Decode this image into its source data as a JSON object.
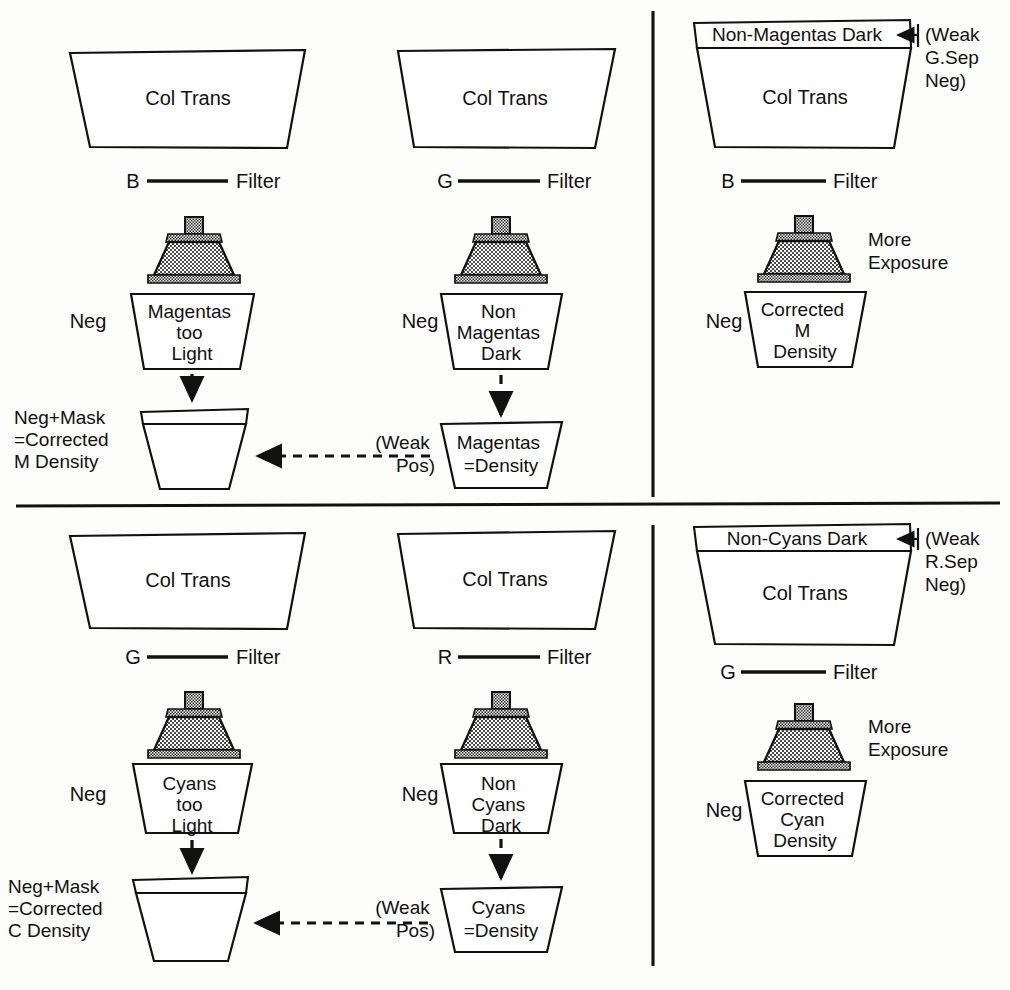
{
  "diagram": {
    "ink": "#111111",
    "paper": "#fdfdfb",
    "icon_names": {
      "enlarger": "enlarger-icon",
      "arrow_down": "arrow-down-icon",
      "arrow_left": "arrow-left-icon",
      "filter_line": "filter-line-icon"
    }
  },
  "panels": [
    {
      "id": "magenta",
      "columns": [
        {
          "id": "m-left",
          "source": {
            "label": "Col Trans"
          },
          "filter": {
            "channel": "B",
            "label": "Filter"
          },
          "exposure_note": "",
          "neg_label": "Neg",
          "neg": {
            "label": "Magentas\ntoo\nLight",
            "lines": [
              "Magentas",
              "too",
              "Light"
            ]
          },
          "result_label": {
            "lines": [
              "Neg+Mask",
              "=Corrected",
              "M Density"
            ]
          },
          "result": {
            "lines": []
          }
        },
        {
          "id": "m-mid",
          "source": {
            "label": "Col Trans"
          },
          "filter": {
            "channel": "G",
            "label": "Filter"
          },
          "neg_label": "Neg",
          "neg": {
            "lines": [
              "Non",
              "Magentas",
              "Dark"
            ]
          },
          "side_label": {
            "lines": [
              "(Weak",
              "Pos)"
            ]
          },
          "result": {
            "lines": [
              "Magentas",
              "=Density"
            ]
          }
        },
        {
          "id": "m-right",
          "strip": {
            "label": "Non-Magentas Dark"
          },
          "strip_note": {
            "lines": [
              "(Weak",
              "G.Sep",
              "Neg)"
            ]
          },
          "source": {
            "label": "Col Trans"
          },
          "filter": {
            "channel": "B",
            "label": "Filter"
          },
          "exposure_note": {
            "lines": [
              "More",
              "Exposure"
            ]
          },
          "neg_label": "Neg",
          "neg": {
            "lines": [
              "Corrected",
              "M",
              "Density"
            ]
          }
        }
      ]
    },
    {
      "id": "cyan",
      "columns": [
        {
          "id": "c-left",
          "source": {
            "label": "Col Trans"
          },
          "filter": {
            "channel": "G",
            "label": "Filter"
          },
          "neg_label": "Neg",
          "neg": {
            "lines": [
              "Cyans",
              "too",
              "Light"
            ]
          },
          "result_label": {
            "lines": [
              "Neg+Mask",
              "=Corrected",
              "C Density"
            ]
          },
          "result": {
            "lines": []
          }
        },
        {
          "id": "c-mid",
          "source": {
            "label": "Col Trans"
          },
          "filter": {
            "channel": "R",
            "label": "Filter"
          },
          "neg_label": "Neg",
          "neg": {
            "lines": [
              "Non",
              "Cyans",
              "Dark"
            ]
          },
          "side_label": {
            "lines": [
              "(Weak",
              "Pos)"
            ]
          },
          "result": {
            "lines": [
              "Cyans",
              "=Density"
            ]
          }
        },
        {
          "id": "c-right",
          "strip": {
            "label": "Non-Cyans Dark"
          },
          "strip_note": {
            "lines": [
              "(Weak",
              "R.Sep",
              "Neg)"
            ]
          },
          "source": {
            "label": "Col Trans"
          },
          "filter": {
            "channel": "G",
            "label": "Filter"
          },
          "exposure_note": {
            "lines": [
              "More",
              "Exposure"
            ]
          },
          "neg_label": "Neg",
          "neg": {
            "lines": [
              "Corrected",
              "Cyan",
              "Density"
            ]
          }
        }
      ]
    }
  ]
}
